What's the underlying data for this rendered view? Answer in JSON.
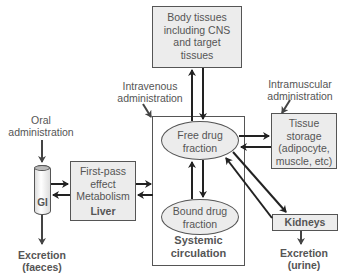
{
  "diagram": {
    "nodes": {
      "body_tissues": {
        "lines": [
          "Body tissues",
          "including CNS",
          "and target",
          "tissues"
        ]
      },
      "systemic_circulation": {
        "label": [
          "Systemic",
          "circulation"
        ]
      },
      "free_drug": {
        "lines": [
          "Free drug",
          "fraction"
        ]
      },
      "bound_drug": {
        "lines": [
          "Bound drug",
          "fraction"
        ]
      },
      "tissue_storage": {
        "lines": [
          "Tissue",
          "storage",
          "(adipocyte,",
          "muscle, etc)"
        ]
      },
      "liver": {
        "lines": [
          "First-pass",
          "effect",
          "Metabolism"
        ],
        "label": "Liver"
      },
      "gi": {
        "label": "GI"
      },
      "kidneys": {
        "label": "Kidneys"
      }
    },
    "labels": {
      "intravenous": [
        "Intravenous",
        "administration"
      ],
      "intramuscular": [
        "Intramuscular",
        "administration"
      ],
      "oral": [
        "Oral",
        "administration"
      ],
      "excretion_faeces": [
        "Excretion",
        "(faeces)"
      ],
      "excretion_urine": [
        "Excretion",
        "(urine)"
      ]
    },
    "colors": {
      "box_fill": "#ececec",
      "stroke": "#555555",
      "arrow": "#222222",
      "text": "#555555"
    }
  }
}
